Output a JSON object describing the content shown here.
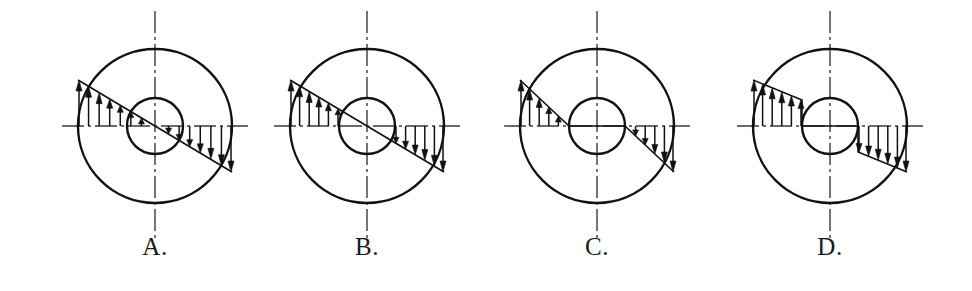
{
  "figure": {
    "kind": "engineering-diagram",
    "background_color": "#ffffff",
    "line_color": "#111111",
    "axis_color": "#3a3a3a",
    "panel_count": 4
  },
  "geometry": {
    "canvas_width": 972,
    "canvas_height": 291,
    "outer_radius": 77,
    "inner_radius": 28,
    "axis_y": 126,
    "axis_overhang": 16,
    "vertical_overhang": 38
  },
  "panels": [
    {
      "id": "A",
      "label": "A.",
      "center_x": 155,
      "center_y": 126,
      "profile_type": "linear-through-center-full",
      "profile_note": "Straight sloped envelope from outer edge through the centre; arrows drawn across the whole diameter including inside the bore",
      "arrows_inside_bore": true,
      "envelope_breaks_at_bore": false,
      "left_arrow_count": 7,
      "right_arrow_count": 7,
      "peak_magnitude": 46,
      "bore_edge_magnitude": 17,
      "center_magnitude": 0
    },
    {
      "id": "B",
      "label": "B.",
      "center_x": 367,
      "center_y": 126,
      "profile_type": "linear-through-center-annulus-only",
      "profile_note": "Same straight sloped envelope through the centre, but arrows only drawn in the annulus outside the bore",
      "arrows_inside_bore": false,
      "envelope_breaks_at_bore": false,
      "left_arrow_count": 5,
      "right_arrow_count": 5,
      "peak_magnitude": 46,
      "bore_edge_magnitude": 17,
      "center_magnitude": 0
    },
    {
      "id": "C",
      "label": "C.",
      "center_x": 597,
      "center_y": 126,
      "profile_type": "linear-to-zero-at-bore",
      "profile_note": "Envelope falls linearly from the outer edge to zero exactly at the bore wall; nothing inside the bore",
      "arrows_inside_bore": false,
      "envelope_breaks_at_bore": false,
      "left_arrow_count": 5,
      "right_arrow_count": 5,
      "peak_magnitude": 46,
      "bore_edge_magnitude": 0,
      "center_magnitude": 0
    },
    {
      "id": "D",
      "label": "D.",
      "center_x": 830,
      "center_y": 126,
      "profile_type": "stepped-at-bore",
      "profile_note": "Envelope slopes down from the outer edge then steps vertically to zero at the bore wall; nothing inside the bore",
      "arrows_inside_bore": false,
      "envelope_breaks_at_bore": true,
      "left_arrow_count": 5,
      "right_arrow_count": 5,
      "peak_magnitude": 46,
      "bore_edge_magnitude": 26,
      "center_magnitude": 0
    }
  ],
  "colors": {
    "stroke": "#111111",
    "axis": "#3a3a3a",
    "label": "#1a1a1a",
    "page": "#ffffff"
  }
}
